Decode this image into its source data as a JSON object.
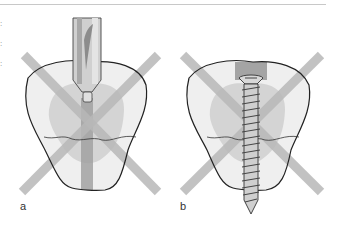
{
  "figure": {
    "panels": [
      {
        "label": "a",
        "tool": "drill",
        "description": "drill bit entering tooth crown, crossed out"
      },
      {
        "label": "b",
        "tool": "screw",
        "description": "screw inserted through tooth, crossed out"
      }
    ],
    "edge_text": [
      ":",
      ":",
      ":"
    ],
    "colors": {
      "cross": "#b8b8b8",
      "tooth_fill": "#efefef",
      "pulp": "#d2d2d2",
      "outline": "#222222",
      "channel": "#9a9a9a",
      "metal": "#c6c6c6"
    }
  }
}
